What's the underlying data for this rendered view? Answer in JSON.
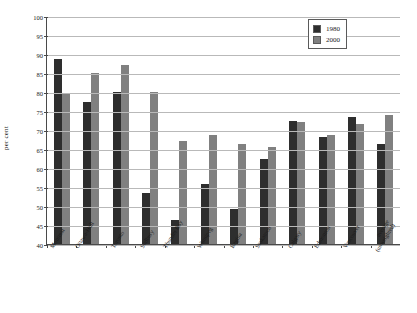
{
  "chart_data": {
    "type": "bar",
    "title": "",
    "xlabel": "",
    "ylabel": "per cent",
    "ylim": [
      40,
      100
    ],
    "ytick_step": 5,
    "yticks": [
      100,
      95,
      90,
      85,
      80,
      75,
      70,
      65,
      60,
      55,
      50,
      45,
      40
    ],
    "grid": true,
    "legend_position": "top-right",
    "categories": [
      "Montreal",
      "Ottawa-Hull",
      "Toronto",
      "Sudbury",
      "Thunder Bay",
      "Winnipeg",
      "Regina",
      "Saskatoon",
      "Calgary",
      "Edmonton",
      "Vancouver",
      "average (unweighted)"
    ],
    "series": [
      {
        "name": "1980",
        "color": "#2e2e2e",
        "values": [
          88.8,
          77.5,
          80.0,
          53.4,
          46.2,
          55.7,
          49.2,
          62.5,
          72.3,
          68.1,
          73.4,
          66.3
        ]
      },
      {
        "name": "2000",
        "color": "#808080",
        "values": [
          79.5,
          85.0,
          87.0,
          80.0,
          67.0,
          68.6,
          66.3,
          65.6,
          72.0,
          68.8,
          71.6,
          74.0
        ]
      }
    ]
  },
  "legend": {
    "items": [
      {
        "label": "1980",
        "swatch": "s1980"
      },
      {
        "label": "2000",
        "swatch": "s2000"
      }
    ]
  },
  "axis": {
    "y_title": "per cent"
  }
}
